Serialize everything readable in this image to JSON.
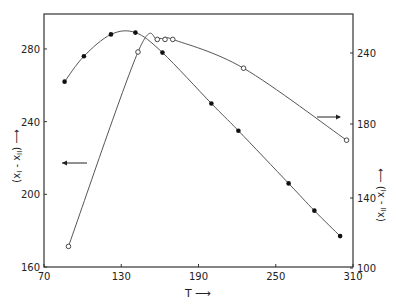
{
  "chart_data": {
    "type": "line",
    "title": "",
    "xlabel": "T",
    "ylabel_left": "(x_I - x_II)",
    "ylabel_right": "(x_II - x_I)",
    "xlim": [
      70,
      310
    ],
    "ylim_left": [
      160,
      300
    ],
    "ylim_right": [
      100,
      250
    ],
    "x_ticks": [
      70,
      130,
      190,
      250,
      310
    ],
    "y_ticks_left": [
      160,
      200,
      240,
      280
    ],
    "y_ticks_right": [
      {
        "label": "100",
        "py": 268
      },
      {
        "label": "140",
        "py": 198
      },
      {
        "label": "180",
        "py": 124
      },
      {
        "label": "240",
        "py": 53
      }
    ],
    "grid": false,
    "legend": "none; arrows indicate axis for each curve",
    "annotations": [
      {
        "text": "arrow pointing left",
        "target": "left axis (filled circles)"
      },
      {
        "text": "arrow pointing right",
        "target": "right axis (open circles)"
      }
    ],
    "series": [
      {
        "name": "(x_I - x_II) filled circles",
        "axis": "left",
        "marker": "filled-circle",
        "x": [
          86,
          101,
          122,
          141,
          162,
          200,
          221,
          260,
          280,
          300
        ],
        "y": [
          262,
          276,
          288,
          289,
          278,
          250,
          235,
          206,
          191,
          177
        ]
      },
      {
        "name": "(x_II - x_I) open circles",
        "axis": "right",
        "marker": "open-circle",
        "x": [
          89,
          143,
          158,
          164,
          170,
          225,
          305
        ],
        "y": [
          112,
          220,
          227,
          227,
          227,
          211,
          171
        ]
      }
    ]
  },
  "labels": {
    "x_axis": "T",
    "x_arrow": "⟶",
    "left_axis": "(x",
    "left_sub1": "I",
    "left_mid": " - x",
    "left_sub2": "II",
    "left_close": ")",
    "right_axis": "(x",
    "right_sub1": "II",
    "right_mid": " - x",
    "right_sub2": "I",
    "right_close": ")"
  }
}
